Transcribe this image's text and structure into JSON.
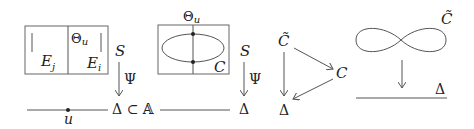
{
  "diagram": {
    "panel1": {
      "box_label_left": "E",
      "box_label_left_sub": "j",
      "box_label_right": "E",
      "box_label_right_sub": "i",
      "theta": "Θ",
      "theta_sub": "u",
      "surface": "S",
      "map": "Ψ",
      "base": "Δ ⊂ 𝔸",
      "point": "u"
    },
    "panel2": {
      "theta": "Θ",
      "theta_sub": "u",
      "curve": "C",
      "surface": "S",
      "map": "Ψ",
      "base_left": "𝔸",
      "base": "Δ"
    },
    "panel3": {
      "cover": "C̃",
      "curve": "C",
      "base": "Δ"
    },
    "panel4": {
      "cover": "C̃",
      "base": "Δ"
    },
    "colors": {
      "stroke": "#555555",
      "text": "#222222",
      "background": "#ffffff"
    }
  }
}
